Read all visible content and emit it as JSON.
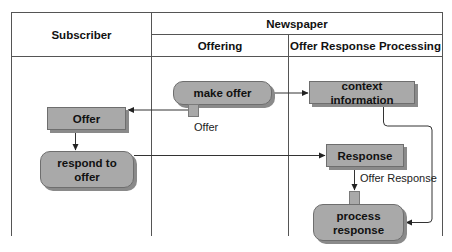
{
  "diagram": {
    "type": "activity-swimlane",
    "headers": {
      "subscriber": "Subscriber",
      "newspaper": "Newspaper",
      "offering": "Offering",
      "offer_response_processing": "Offer Response Processing"
    },
    "nodes": {
      "make_offer": "make offer",
      "context_information": "context information",
      "offer_object": "Offer",
      "respond_to_offer_line1": "respond to",
      "respond_to_offer_line2": "offer",
      "response_object": "Response",
      "process_response_line1": "process",
      "process_response_line2": "response"
    },
    "pin_labels": {
      "offer_pin": "Offer",
      "offer_response_pin": "Offer Response"
    },
    "edges": [
      {
        "from": "make offer",
        "to": "context information"
      },
      {
        "from": "make offer (Offer pin)",
        "to": "Offer"
      },
      {
        "from": "Offer",
        "to": "respond to offer"
      },
      {
        "from": "respond to offer",
        "to": "Response"
      },
      {
        "from": "Response",
        "to": "process response (Offer Response pin)"
      },
      {
        "from": "context information",
        "to": "process response"
      }
    ],
    "colors": {
      "node_fill": "#a9a9a9",
      "node_border": "#6e6e6e",
      "shadow": "#8a8a8a",
      "line": "#333333"
    }
  }
}
